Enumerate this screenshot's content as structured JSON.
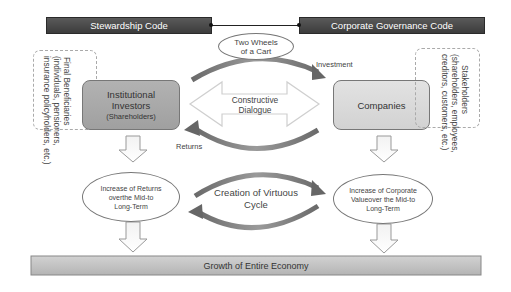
{
  "codes": {
    "left": "Stewardship Code",
    "right": "Corporate Governance Code",
    "link_label": "Two Wheels of a Cart",
    "link_label_lines": [
      "Two Wheels",
      "of a Cart"
    ]
  },
  "left_side": {
    "beneficiaries": {
      "title": "Final Beneficiaries",
      "detail_lines": [
        "(individuals, pensioners,",
        "insurance policyholders, etc.)"
      ]
    },
    "investors": {
      "lines": [
        "Institutional",
        "Investors"
      ],
      "sub": "(Shareholders)"
    },
    "outcome_lines": [
      "Increase of Returns",
      "overthe Mid-to",
      "Long-Term"
    ]
  },
  "center": {
    "investment_label": "Investment",
    "returns_label": "Returns",
    "dialogue_lines": [
      "Constructive",
      "Dialogue"
    ],
    "cycle_lines": [
      "Creation of Virtuous",
      "Cycle"
    ]
  },
  "right_side": {
    "companies": "Companies",
    "stakeholders": {
      "title": "Stakeholders",
      "detail_lines": [
        "(shareholders, employees,",
        "creditors, customers, etc.)"
      ]
    },
    "outcome_lines": [
      "Increase of Corporate",
      "Valueover the Mid-to",
      "Long-Term"
    ]
  },
  "bottom": {
    "economy": "Growth of Entire Economy"
  },
  "colors": {
    "code_bar": "#484848",
    "investors_fill": "#a9a9a9",
    "companies_fill": "#d9d9d9",
    "arc": "#777777",
    "economy_bar": "#c4c4c4"
  }
}
